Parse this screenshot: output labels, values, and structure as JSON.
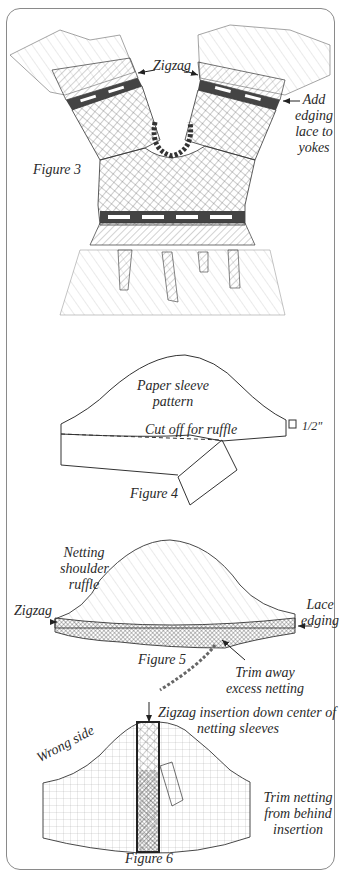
{
  "figure3": {
    "caption": "Figure 3",
    "label_zigzag": "Zigzag",
    "label_add_edging": [
      "Add",
      "edging",
      "lace to",
      "yokes"
    ]
  },
  "figure4": {
    "caption": "Figure 4",
    "label_pattern": [
      "Paper sleeve",
      "pattern"
    ],
    "label_cut": "Cut off for ruffle",
    "label_measure": "1/2\""
  },
  "figure5": {
    "caption": "Figure 5",
    "label_netting": [
      "Netting",
      "shoulder",
      "ruffle"
    ],
    "label_zigzag": "Zigzag",
    "label_lace": [
      "Lace",
      "edging"
    ],
    "label_trim": [
      "Trim away",
      "excess netting"
    ]
  },
  "figure6": {
    "caption": "Figure 6",
    "label_insertion": [
      "Zigzag insertion down center of",
      "netting sleeves"
    ],
    "label_wrong_side": "Wrong side",
    "label_trim": [
      "Trim netting",
      "from behind",
      "insertion"
    ]
  },
  "colors": {
    "ink": "#2a2a2a",
    "frame": "#8a8a8a",
    "paper": "#ffffff"
  }
}
